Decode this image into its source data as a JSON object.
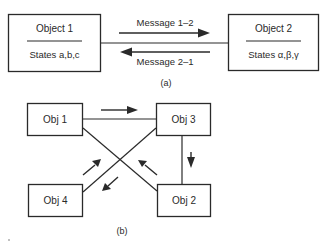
{
  "diagram_a": {
    "caption": "(a)",
    "object1": {
      "name": "Object 1",
      "states": "States a,b,c"
    },
    "object2": {
      "name": "Object 2",
      "states": "States α,β,γ"
    },
    "messages": [
      {
        "label": "Message 1–2",
        "direction": "object1-to-object2"
      },
      {
        "label": "Message 2–1",
        "direction": "object2-to-object1"
      }
    ]
  },
  "diagram_b": {
    "caption": "(b)",
    "objects": [
      {
        "id": "obj1",
        "label": "Obj 1"
      },
      {
        "id": "obj3",
        "label": "Obj 3"
      },
      {
        "id": "obj4",
        "label": "Obj 4"
      },
      {
        "id": "obj2",
        "label": "Obj 2"
      }
    ],
    "flows": [
      {
        "from": "Obj 1",
        "to": "Obj 3"
      },
      {
        "from": "Obj 3",
        "to": "Obj 2"
      },
      {
        "from": "Obj 2",
        "to": "Obj 1"
      },
      {
        "from": "Obj 4",
        "to": "Obj 3"
      },
      {
        "from": "Obj 3",
        "to": "Obj 4"
      }
    ]
  },
  "colors": {
    "ink": "#2a2a2a",
    "background": "#ffffff"
  }
}
